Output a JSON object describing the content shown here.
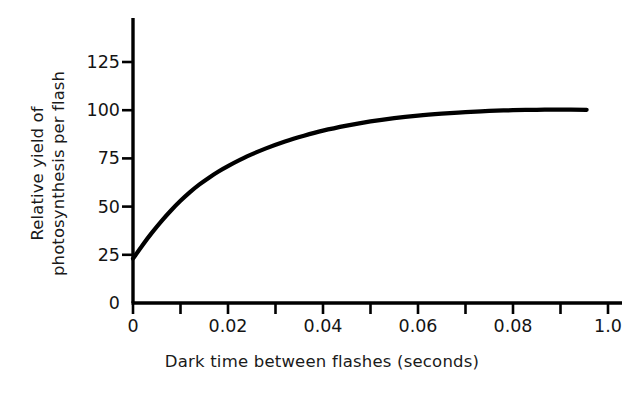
{
  "chart_data": {
    "type": "line",
    "title": "",
    "xlabel": "Dark time between flashes (seconds)",
    "ylabel": "Relative yield of photosynthesis per flash",
    "ylabel_lines": [
      "Relative yield of",
      "photosynthesis per flash"
    ],
    "grid": false,
    "legend": "none",
    "xlim": [
      0,
      0.1
    ],
    "ylim": [
      0,
      137
    ],
    "xticks": [
      0,
      0.02,
      0.04,
      0.06,
      0.08,
      0.1
    ],
    "xtick_labels": [
      "0",
      "0.02",
      "0.04",
      "0.06",
      "0.08",
      "1.0"
    ],
    "yticks": [
      0,
      25,
      50,
      75,
      100,
      125
    ],
    "ytick_labels": [
      "0",
      "25",
      "50",
      "75",
      "100",
      "125"
    ],
    "x_minor_ticks_between": 1,
    "series": [
      {
        "name": "Relative yield of photosynthesis per flash",
        "color": "#000000",
        "x": [
          0.0,
          0.002,
          0.004,
          0.006,
          0.008,
          0.01,
          0.012,
          0.014,
          0.016,
          0.018,
          0.02,
          0.024,
          0.028,
          0.032,
          0.036,
          0.04,
          0.045,
          0.05,
          0.055,
          0.06,
          0.065,
          0.07,
          0.075,
          0.08,
          0.085,
          0.09,
          0.0955
        ],
        "y": [
          23.0,
          30.0,
          36.5,
          42.5,
          48.0,
          53.0,
          57.5,
          61.5,
          65.0,
          68.2,
          71.0,
          76.0,
          80.2,
          83.8,
          86.8,
          89.4,
          92.0,
          94.2,
          95.9,
          97.2,
          98.2,
          99.0,
          99.6,
          100.0,
          100.2,
          100.3,
          100.2
        ]
      }
    ]
  },
  "axis": {
    "y_title_line1": "Relative yield of",
    "y_title_line2": "photosynthesis per flash",
    "x_title": "Dark time between flashes (seconds)"
  }
}
